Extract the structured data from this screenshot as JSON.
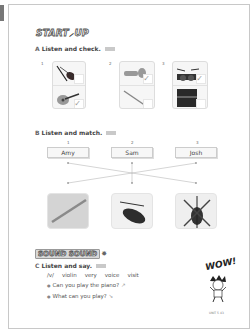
{
  "page": {
    "logo_start": "START",
    "logo_up": "UP",
    "section_a": {
      "letter": "A",
      "title": "Listen and check.",
      "items": [
        {
          "number": "1",
          "top": "violin",
          "bottom": "guitar",
          "checked": "bottom"
        },
        {
          "number": "2",
          "top": "trumpet",
          "bottom": "flute",
          "checked": "top"
        },
        {
          "number": "3",
          "top": "drums",
          "bottom": "piano",
          "checked": "top"
        }
      ],
      "check_mark": "✓"
    },
    "section_b": {
      "letter": "B",
      "title": "Listen and match.",
      "numbers": [
        "1",
        "2",
        "3"
      ],
      "names": [
        "Amy",
        "Sam",
        "Josh"
      ],
      "pictures": [
        "flute",
        "violin",
        "violin-crossed"
      ]
    },
    "sound_logo": "SOUND SOUND",
    "section_c": {
      "letter": "C",
      "title": "Listen and say.",
      "phoneme": "/v/",
      "words": [
        "violin",
        "very",
        "voice",
        "visit"
      ],
      "sentences": [
        "Can you play the piano?",
        "What can you play?"
      ]
    },
    "wow": "WOW!",
    "page_number": "UNIT 5  43"
  }
}
